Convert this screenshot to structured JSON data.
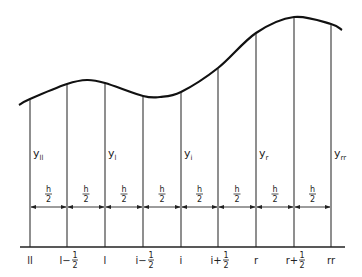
{
  "diagram": {
    "type": "numerical-integration-grid",
    "curve_points": [
      [
        19,
        105
      ],
      [
        30,
        99
      ],
      [
        67,
        84
      ],
      [
        87,
        80
      ],
      [
        105,
        83
      ],
      [
        143,
        96
      ],
      [
        160,
        97
      ],
      [
        181,
        92
      ],
      [
        218,
        68
      ],
      [
        256,
        33
      ],
      [
        294,
        17
      ],
      [
        331,
        24
      ],
      [
        342,
        30
      ]
    ],
    "axis": {
      "y": 247,
      "x_start": 20,
      "x_end": 345
    },
    "ordinates": [
      {
        "x": 30,
        "label": "ll",
        "main": "ll"
      },
      {
        "x": 67,
        "label": "l-1/2",
        "main": "l−",
        "frac_num": "1",
        "frac_den": "2"
      },
      {
        "x": 105,
        "label": "l",
        "main": "l"
      },
      {
        "x": 143,
        "label": "i-1/2",
        "main": "i−",
        "frac_num": "1",
        "frac_den": "2"
      },
      {
        "x": 181,
        "label": "i",
        "main": "i"
      },
      {
        "x": 218,
        "label": "i+1/2",
        "main": "i+",
        "frac_num": "1",
        "frac_den": "2"
      },
      {
        "x": 256,
        "label": "r",
        "main": "r"
      },
      {
        "x": 294,
        "label": "r+1/2",
        "main": "r+",
        "frac_num": "1",
        "frac_den": "2"
      },
      {
        "x": 331,
        "label": "rr",
        "main": "rr"
      }
    ],
    "y_labels": [
      {
        "x": 33,
        "base": "y",
        "sub": "ll"
      },
      {
        "x": 108,
        "base": "y",
        "sub": "l"
      },
      {
        "x": 184,
        "base": "y",
        "sub": "i"
      },
      {
        "x": 259,
        "base": "y",
        "sub": "r"
      },
      {
        "x": 334,
        "base": "y",
        "sub": "rr"
      }
    ],
    "spacing_label": {
      "num": "h",
      "den": "2"
    },
    "arrow_y": 207,
    "colors": {
      "line": "#222222",
      "curve": "#111111",
      "background": "#ffffff"
    }
  }
}
